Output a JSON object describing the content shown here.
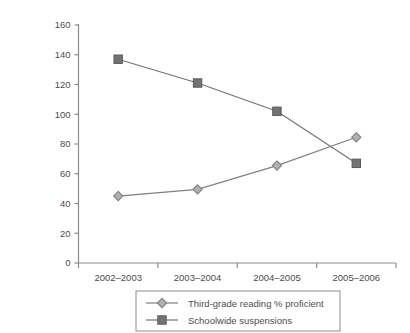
{
  "chart_data": {
    "type": "line",
    "title": "",
    "subtitle": "",
    "xlabel": "",
    "ylabel": "",
    "categories": [
      "2002–2003",
      "2003–2004",
      "2004–2005",
      "2005–2006"
    ],
    "series": [
      {
        "name": "Third-grade reading % proficient",
        "marker": "diamond",
        "color": "#808080",
        "values": [
          45,
          49.5,
          65.5,
          84.5
        ]
      },
      {
        "name": "Schoolwide suspensions",
        "marker": "square",
        "color": "#737373",
        "values": [
          137,
          121,
          102,
          67
        ]
      }
    ],
    "ylim": [
      0,
      160
    ],
    "ytick_step": 20,
    "yticks": [
      "0",
      "20",
      "40",
      "60",
      "80",
      "100",
      "120",
      "140",
      "160"
    ],
    "grid": false,
    "legend_position": "bottom"
  },
  "legend": {
    "entries": [
      {
        "label": "Third-grade reading % proficient",
        "marker": "diamond-marker"
      },
      {
        "label": "Schoolwide suspensions",
        "marker": "square-marker"
      }
    ]
  },
  "axes": {
    "y_axis_name": "y-axis",
    "x_axis_name": "x-axis"
  }
}
